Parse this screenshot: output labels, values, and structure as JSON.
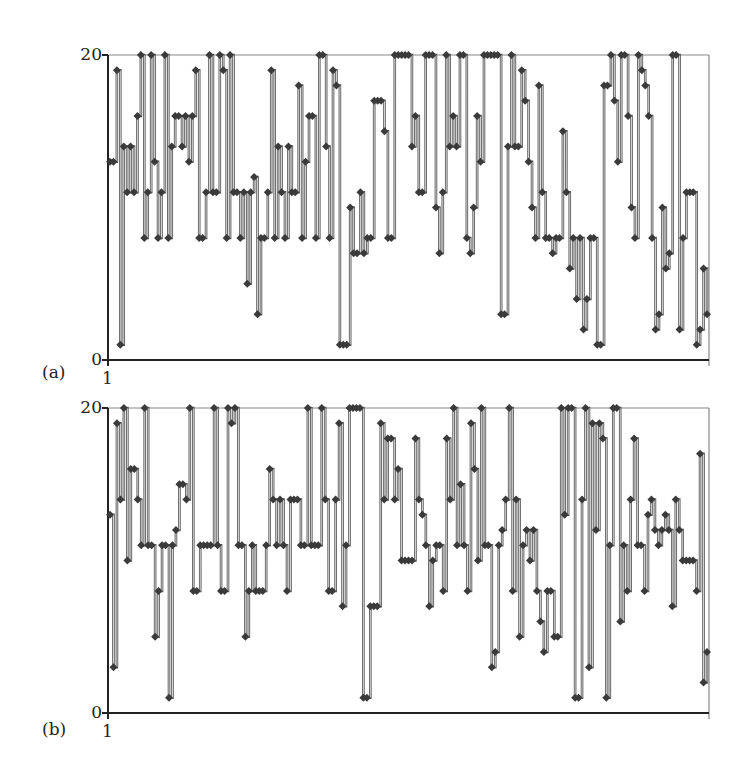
{
  "chart_data": [
    {
      "panel_label": "(a)",
      "type": "line",
      "style": "step line with diamond markers",
      "ylim": [
        0,
        20
      ],
      "yticks": [
        "0",
        "20"
      ],
      "xticks": [
        "1"
      ],
      "xlabel": "",
      "ylabel": "",
      "grid": false,
      "legend": null,
      "values": [
        13,
        13,
        19,
        1,
        14,
        11,
        14,
        11,
        16,
        20,
        8,
        11,
        20,
        13,
        8,
        11,
        20,
        8,
        14,
        16,
        16,
        14,
        16,
        13,
        16,
        19,
        8,
        8,
        11,
        20,
        11,
        11,
        20,
        19,
        8,
        20,
        11,
        11,
        8,
        11,
        5,
        11,
        12,
        3,
        8,
        8,
        11,
        19,
        8,
        14,
        11,
        8,
        14,
        11,
        11,
        18,
        8,
        13,
        16,
        16,
        8,
        20,
        20,
        14,
        8,
        19,
        18,
        1,
        1,
        1,
        10,
        7,
        7,
        11,
        7,
        8,
        8,
        17,
        17,
        17,
        15,
        8,
        8,
        20,
        20,
        20,
        20,
        20,
        14,
        16,
        11,
        11,
        20,
        20,
        20,
        10,
        7,
        11,
        20,
        14,
        16,
        14,
        20,
        20,
        8,
        7,
        10,
        16,
        13,
        20,
        20,
        20,
        20,
        20,
        3,
        3,
        14,
        20,
        14,
        14,
        19,
        17,
        13,
        10,
        8,
        18,
        11,
        8,
        8,
        7,
        8,
        8,
        15,
        11,
        6,
        8,
        4,
        8,
        2,
        4,
        8,
        8,
        1,
        1,
        18,
        18,
        20,
        17,
        13,
        20,
        20,
        16,
        10,
        8,
        20,
        19,
        18,
        16,
        8,
        2,
        3,
        10,
        6,
        7,
        20,
        20,
        2,
        8,
        11,
        11,
        11,
        1,
        2,
        6,
        3
      ],
      "series_count": 1
    },
    {
      "panel_label": "(b)",
      "type": "line",
      "style": "step line with diamond markers",
      "ylim": [
        0,
        20
      ],
      "yticks": [
        "0",
        "20"
      ],
      "xticks": [
        "1"
      ],
      "xlabel": "",
      "ylabel": "",
      "grid": false,
      "legend": null,
      "values": [
        13,
        3,
        19,
        14,
        20,
        10,
        16,
        16,
        14,
        11,
        20,
        11,
        11,
        5,
        8,
        11,
        11,
        1,
        11,
        12,
        15,
        15,
        14,
        20,
        8,
        8,
        11,
        11,
        11,
        11,
        20,
        11,
        8,
        8,
        20,
        19,
        20,
        11,
        11,
        5,
        8,
        11,
        8,
        8,
        8,
        11,
        16,
        14,
        11,
        14,
        11,
        8,
        14,
        14,
        14,
        11,
        11,
        20,
        11,
        11,
        11,
        20,
        14,
        8,
        8,
        14,
        19,
        7,
        11,
        20,
        20,
        20,
        20,
        1,
        1,
        7,
        7,
        7,
        19,
        14,
        18,
        18,
        14,
        16,
        10,
        10,
        10,
        10,
        18,
        14,
        13,
        11,
        7,
        10,
        11,
        11,
        8,
        18,
        14,
        20,
        11,
        15,
        11,
        8,
        19,
        16,
        10,
        20,
        11,
        11,
        3,
        4,
        11,
        12,
        14,
        20,
        8,
        14,
        5,
        11,
        12,
        10,
        12,
        8,
        6,
        4,
        8,
        8,
        5,
        5,
        20,
        13,
        20,
        20,
        1,
        1,
        14,
        20,
        3,
        19,
        12,
        19,
        18,
        1,
        11,
        20,
        20,
        6,
        11,
        8,
        14,
        18,
        11,
        11,
        8,
        13,
        14,
        12,
        11,
        12,
        13,
        12,
        7,
        14,
        12,
        10,
        10,
        10,
        10,
        8,
        17,
        2,
        4
      ],
      "series_count": 1
    }
  ],
  "panels": {
    "a": {
      "label": "(a)",
      "y_top": "20",
      "y_bottom": "0",
      "x_first": "1"
    },
    "b": {
      "label": "(b)",
      "y_top": "20",
      "y_bottom": "0",
      "x_first": "1"
    }
  },
  "colors": {
    "line": "#555555",
    "marker": "#3a3a3a",
    "axis": "#222222",
    "frame": "#888888"
  }
}
